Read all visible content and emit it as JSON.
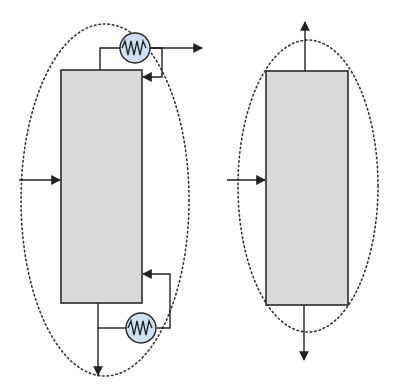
{
  "diagram": {
    "title": "",
    "colors": {
      "column_fill": "#d9dadb",
      "column_stroke": "#2a2a2a",
      "line": "#222222",
      "exchanger_fill": "#cfe0f3",
      "exchanger_stroke": "#222222",
      "boundary": "#333333"
    },
    "left_system": {
      "name": "Distillation column with condenser and reboiler",
      "components": [
        "column",
        "condenser",
        "reboiler",
        "feed-stream",
        "distillate-stream",
        "bottoms-stream",
        "reflux-stream",
        "boilup-stream",
        "system-boundary"
      ]
    },
    "right_system": {
      "name": "Simplified column envelope",
      "components": [
        "column",
        "feed-stream",
        "top-product-stream",
        "bottom-product-stream",
        "system-boundary"
      ]
    }
  }
}
